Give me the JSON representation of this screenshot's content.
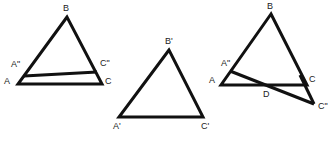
{
  "diagram": {
    "background": "#ffffff",
    "stroke_color": "#111111",
    "figures": [
      {
        "name": "triangle-ABC-with-parallel",
        "labels": {
          "B": "B",
          "A": "A",
          "C": "C",
          "A2": "A\"",
          "C2": "C\""
        }
      },
      {
        "name": "triangle-A1B1C1",
        "labels": {
          "B": "B'",
          "A": "A'",
          "C": "C'"
        }
      },
      {
        "name": "triangle-ABC-with-crossing",
        "labels": {
          "B": "B",
          "A": "A",
          "C": "C",
          "A2": "A\"",
          "C2": "C\"",
          "D": "D"
        }
      }
    ]
  }
}
